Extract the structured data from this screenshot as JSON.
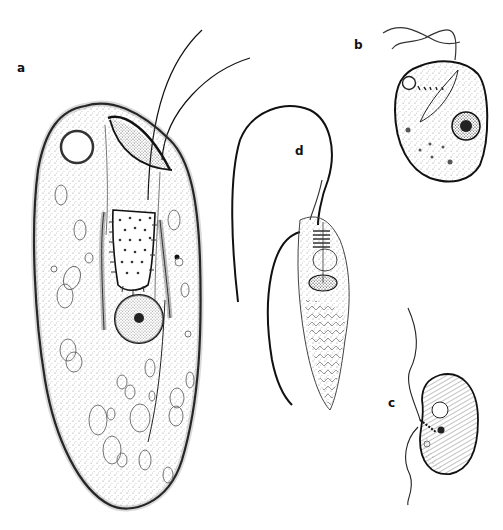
{
  "figure": {
    "panels": [
      {
        "id": "a",
        "label": "a",
        "label_pos": [
          17,
          62
        ],
        "subject": "large elongate flagellate cell with two anterior flagella, contractile vacuole, striated rod-like feeding apparatus and nucleus"
      },
      {
        "id": "b",
        "label": "b",
        "label_pos": [
          354,
          39
        ],
        "subject": "oval cell with two long flagella, anterior vacuole, dotted row and round nucleus"
      },
      {
        "id": "c",
        "label": "c",
        "label_pos": [
          388,
          397
        ],
        "subject": "bean-shaped cell with striated surface, vacuole, small nucleus and two flagella"
      },
      {
        "id": "d",
        "label": "d",
        "label_pos": [
          295,
          145
        ],
        "subject": "spindle-shaped cell with long trailing flagellum and chevron-patterned posterior"
      }
    ],
    "colors": {
      "ink": "#111111",
      "stipple": "#555555",
      "paper": "#ffffff"
    }
  }
}
